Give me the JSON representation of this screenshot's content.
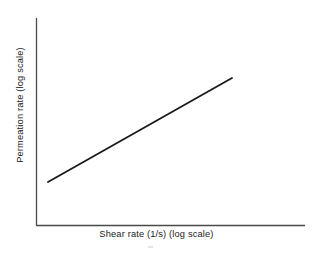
{
  "figure": {
    "background_color": "#ffffff",
    "width": 313,
    "height": 253
  },
  "chart_data": {
    "type": "line",
    "title": "",
    "subtitle": "",
    "xlabel": "Shear rate (1/s) (log scale)",
    "ylabel": "Permeation rate (log scale)",
    "xscale": "log",
    "yscale": "log",
    "grid": false,
    "legend": null,
    "xticks": [],
    "yticks": [],
    "xticklabels": [],
    "yticklabels": [],
    "annotations": [],
    "series": [
      {
        "name": "Permeation rate vs shear rate",
        "style": "solid",
        "color": "#1a1a1a",
        "linewidth": 1.8,
        "markers": false,
        "description": "Single straight rising line on log-log axes indicating a power-law relationship",
        "x": [
          0.0,
          1.0
        ],
        "y": [
          0.0,
          1.0
        ],
        "pixel_points": [
          {
            "x": 48,
            "y": 182
          },
          {
            "x": 232,
            "y": 78
          }
        ]
      }
    ],
    "axes_geometry": {
      "x_axis_y": 225,
      "x_axis_start_x": 36,
      "x_axis_end_x": 305,
      "y_axis_x": 36,
      "y_axis_top_y": 18,
      "y_axis_bottom_y": 225,
      "spine_color": "#4a4a4a",
      "spine_width": 1.3
    }
  }
}
